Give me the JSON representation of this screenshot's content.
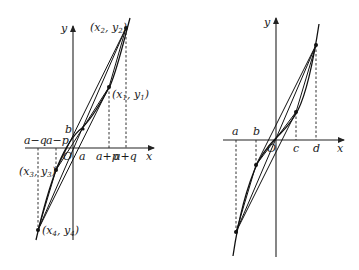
{
  "left_figure": {
    "axis_labels": {
      "x": "x",
      "y": "y",
      "origin": "O"
    },
    "x_ticks_above": [
      "a−q",
      "a−p"
    ],
    "x_ticks_below": [
      "a",
      "a+p",
      "a+q"
    ],
    "y_label_b": "b",
    "points": [
      {
        "name": "(x",
        "sub": "2",
        "mid": ", y",
        "sub2": "2",
        "end": ")"
      },
      {
        "name": "(x",
        "sub": "1",
        "mid": ", y",
        "sub2": "1",
        "end": ")"
      },
      {
        "name": "(x",
        "sub": "3",
        "mid": ", y",
        "sub2": "3",
        "end": ")"
      },
      {
        "name": "(x",
        "sub": "4",
        "mid": ", y",
        "sub2": "4",
        "end": ")"
      }
    ]
  },
  "right_figure": {
    "axis_labels": {
      "x": "x",
      "y": "y",
      "origin": "O"
    },
    "x_ticks_above": [
      "a",
      "b"
    ],
    "x_ticks_below": [
      "c",
      "d"
    ]
  }
}
